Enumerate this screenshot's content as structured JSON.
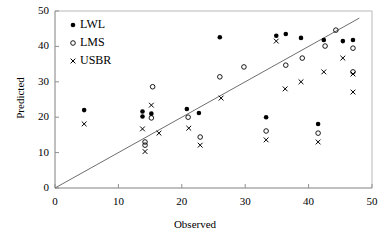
{
  "chart_data": {
    "type": "scatter",
    "title": "",
    "xlabel": "Observed",
    "ylabel": "Predicted",
    "xlim": [
      0,
      50
    ],
    "ylim": [
      0,
      50
    ],
    "xticks": [
      0,
      10,
      20,
      30,
      40,
      50
    ],
    "yticks": [
      0,
      10,
      20,
      30,
      40,
      50
    ],
    "grid": false,
    "legend_position": "top-left",
    "reference_line": {
      "name": "1:1 line",
      "x": [
        0,
        48
      ],
      "y": [
        0,
        48
      ]
    },
    "series": [
      {
        "name": "LWL",
        "marker": "filled-circle",
        "color": "#000000",
        "points": [
          [
            4.6,
            22.0
          ],
          [
            13.8,
            21.6
          ],
          [
            13.8,
            20.2
          ],
          [
            15.2,
            21.0
          ],
          [
            20.8,
            22.3
          ],
          [
            22.7,
            21.2
          ],
          [
            26.0,
            42.6
          ],
          [
            33.3,
            20.0
          ],
          [
            34.9,
            43.0
          ],
          [
            36.4,
            43.5
          ],
          [
            38.8,
            42.4
          ],
          [
            41.5,
            18.1
          ],
          [
            42.4,
            41.8
          ],
          [
            45.4,
            41.5
          ],
          [
            47.0,
            41.8
          ]
        ]
      },
      {
        "name": "LMS",
        "marker": "open-circle",
        "color": "#000000",
        "points": [
          [
            14.2,
            13.0
          ],
          [
            14.2,
            12.1
          ],
          [
            15.2,
            19.8
          ],
          [
            15.4,
            28.6
          ],
          [
            21.0,
            20.0
          ],
          [
            22.9,
            14.4
          ],
          [
            26.0,
            31.4
          ],
          [
            29.8,
            34.2
          ],
          [
            33.3,
            16.1
          ],
          [
            36.4,
            34.7
          ],
          [
            39.0,
            36.7
          ],
          [
            41.5,
            15.5
          ],
          [
            42.6,
            40.1
          ],
          [
            44.3,
            44.6
          ],
          [
            47.0,
            39.5
          ],
          [
            47.0,
            32.8
          ]
        ]
      },
      {
        "name": "USBR",
        "marker": "cross",
        "color": "#000000",
        "points": [
          [
            4.6,
            18.1
          ],
          [
            13.8,
            16.7
          ],
          [
            14.2,
            10.3
          ],
          [
            15.2,
            23.4
          ],
          [
            16.4,
            15.5
          ],
          [
            21.1,
            16.9
          ],
          [
            22.9,
            12.1
          ],
          [
            26.2,
            25.4
          ],
          [
            33.3,
            13.6
          ],
          [
            34.9,
            41.5
          ],
          [
            36.3,
            28.0
          ],
          [
            38.8,
            30.0
          ],
          [
            41.5,
            13.0
          ],
          [
            42.4,
            32.8
          ],
          [
            45.4,
            36.7
          ],
          [
            47.0,
            32.2
          ],
          [
            47.0,
            27.1
          ]
        ]
      }
    ],
    "legend": [
      {
        "label": "LWL",
        "marker": "filled-circle"
      },
      {
        "label": "LMS",
        "marker": "open-circle"
      },
      {
        "label": "USBR",
        "marker": "cross"
      }
    ]
  },
  "axes": {
    "x_title": "Observed",
    "y_title": "Predicted",
    "x_tick_labels": [
      "0",
      "10",
      "20",
      "30",
      "40",
      "50"
    ],
    "y_tick_labels": [
      "0",
      "10",
      "20",
      "30",
      "40",
      "50"
    ]
  },
  "colors": {
    "marker": "#000000",
    "axis": "#808080",
    "line": "#808080",
    "background": "#ffffff"
  }
}
